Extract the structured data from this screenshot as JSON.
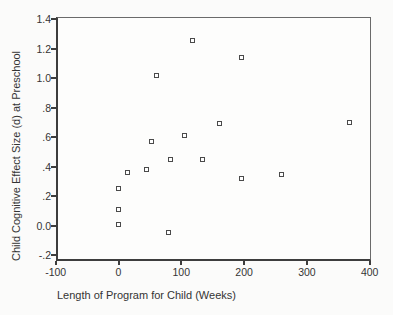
{
  "chart_data": {
    "type": "scatter",
    "title": "",
    "xlabel": "Length of Program for Child (Weeks)",
    "ylabel": "Child Cognitive Effect Size (d) at Preschool",
    "xlim": [
      -100,
      400
    ],
    "ylim": [
      -0.2,
      1.4
    ],
    "grid": false,
    "legend": null,
    "marker": {
      "shape": "open-square",
      "size_px": 5,
      "border_color": "#4a4a4a",
      "fill_color": "#ffffff"
    },
    "x_ticks": {
      "values": [
        -100,
        0,
        100,
        200,
        300,
        400
      ],
      "labels": [
        "-100",
        "0",
        "100",
        "200",
        "300",
        "400"
      ]
    },
    "y_ticks": {
      "values": [
        1.4,
        1.2,
        1.0,
        0.8,
        0.6,
        0.4,
        0.2,
        0.0,
        -0.2
      ],
      "labels": [
        "1.4",
        "1.2",
        "1.0",
        ".8",
        ".6",
        ".4",
        ".2",
        "0.0",
        "-.2"
      ]
    },
    "points": [
      {
        "x": 0,
        "y": 0.25
      },
      {
        "x": 0,
        "y": 0.11
      },
      {
        "x": 0,
        "y": 0.01
      },
      {
        "x": 14,
        "y": 0.36
      },
      {
        "x": 44,
        "y": 0.38
      },
      {
        "x": 52,
        "y": 0.57
      },
      {
        "x": 61,
        "y": 1.02
      },
      {
        "x": 79,
        "y": -0.05
      },
      {
        "x": 82,
        "y": 0.45
      },
      {
        "x": 105,
        "y": 0.61
      },
      {
        "x": 117,
        "y": 1.26
      },
      {
        "x": 133,
        "y": 0.45
      },
      {
        "x": 160,
        "y": 0.69
      },
      {
        "x": 195,
        "y": 1.14
      },
      {
        "x": 196,
        "y": 0.32
      },
      {
        "x": 260,
        "y": 0.35
      },
      {
        "x": 368,
        "y": 0.7
      }
    ],
    "colors": {
      "axis": "#3d3d3d",
      "frame": "#6a6a6a",
      "text": "#2e2e2e",
      "background": "#fbfbfa"
    }
  }
}
